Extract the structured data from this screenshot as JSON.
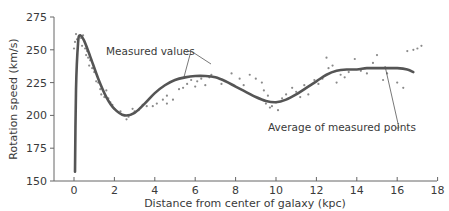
{
  "chart_data": {
    "type": "scatter",
    "title": "",
    "xlabel": "Distance from center of galaxy (kpc)",
    "ylabel": "Rotation speed (km/s)",
    "xlim": [
      -1,
      18
    ],
    "ylim": [
      150,
      275
    ],
    "xticks": [
      0,
      2,
      4,
      6,
      8,
      10,
      12,
      14,
      16,
      18
    ],
    "yticks": [
      150,
      175,
      200,
      225,
      250,
      275
    ],
    "grid": false,
    "legend": null,
    "annotations": [
      {
        "text": "Measured values",
        "points_to": [
          [
            4.4,
            233
          ],
          [
            6.6,
            222
          ]
        ]
      },
      {
        "text": "Average of measured points",
        "points_to": [
          [
            15.1,
            231
          ]
        ]
      }
    ],
    "series": [
      {
        "name": "Average of measured points",
        "type": "line",
        "x": [
          0.05,
          0.1,
          0.2,
          0.3,
          0.5,
          0.8,
          1.2,
          1.6,
          2.0,
          2.5,
          3.0,
          3.5,
          4.0,
          4.5,
          5.0,
          5.5,
          6.0,
          6.5,
          7.0,
          7.5,
          8.0,
          8.5,
          9.0,
          9.5,
          10.0,
          10.5,
          11.0,
          11.5,
          12.0,
          12.5,
          13.0,
          13.5,
          14.0,
          14.5,
          15.0,
          15.5,
          16.0,
          16.5,
          16.8
        ],
        "y": [
          157,
          220,
          255,
          261,
          257,
          245,
          228,
          214,
          205,
          200,
          202,
          209,
          217,
          223,
          227,
          229,
          230,
          230,
          229,
          226,
          222,
          218,
          214,
          211,
          210,
          212,
          216,
          221,
          226,
          231,
          234,
          235,
          235,
          236,
          236,
          236,
          236,
          235,
          233
        ]
      },
      {
        "name": "Measured values",
        "type": "scatter",
        "points": [
          [
            0.0,
            251
          ],
          [
            0.05,
            256
          ],
          [
            0.1,
            262
          ],
          [
            0.15,
            258
          ],
          [
            0.2,
            254
          ],
          [
            0.3,
            261
          ],
          [
            0.35,
            259
          ],
          [
            0.4,
            253
          ],
          [
            0.45,
            261
          ],
          [
            0.55,
            251
          ],
          [
            0.6,
            246
          ],
          [
            0.65,
            249
          ],
          [
            0.7,
            244
          ],
          [
            0.75,
            238
          ],
          [
            0.8,
            242
          ],
          [
            0.9,
            236
          ],
          [
            1.0,
            233
          ],
          [
            1.1,
            226
          ],
          [
            1.2,
            225
          ],
          [
            1.3,
            220
          ],
          [
            1.35,
            216
          ],
          [
            1.5,
            214
          ],
          [
            1.6,
            219
          ],
          [
            1.7,
            213
          ],
          [
            1.8,
            210
          ],
          [
            1.9,
            208
          ],
          [
            2.0,
            205
          ],
          [
            2.3,
            203
          ],
          [
            2.6,
            197
          ],
          [
            2.7,
            199
          ],
          [
            2.9,
            205
          ],
          [
            3.0,
            203
          ],
          [
            3.2,
            204
          ],
          [
            3.4,
            208
          ],
          [
            3.6,
            207
          ],
          [
            3.9,
            207
          ],
          [
            4.1,
            209
          ],
          [
            4.4,
            212
          ],
          [
            4.6,
            215
          ],
          [
            4.6,
            209
          ],
          [
            4.9,
            212
          ],
          [
            5.2,
            220
          ],
          [
            5.4,
            221
          ],
          [
            5.6,
            224
          ],
          [
            5.8,
            227
          ],
          [
            6.0,
            222
          ],
          [
            6.1,
            226
          ],
          [
            6.3,
            228
          ],
          [
            6.5,
            223
          ],
          [
            6.7,
            229
          ],
          [
            6.8,
            231
          ],
          [
            7.3,
            224
          ],
          [
            7.8,
            232
          ],
          [
            8.2,
            228
          ],
          [
            8.4,
            223
          ],
          [
            8.7,
            231
          ],
          [
            9.0,
            228
          ],
          [
            9.3,
            225
          ],
          [
            9.4,
            219
          ],
          [
            9.6,
            215
          ],
          [
            9.8,
            207
          ],
          [
            10.0,
            210
          ],
          [
            9.5,
            209
          ],
          [
            9.7,
            206
          ],
          [
            10.1,
            204
          ],
          [
            10.3,
            213
          ],
          [
            10.5,
            216
          ],
          [
            10.8,
            221
          ],
          [
            11.0,
            218
          ],
          [
            11.2,
            214
          ],
          [
            11.4,
            223
          ],
          [
            11.6,
            216
          ],
          [
            11.9,
            227
          ],
          [
            12.1,
            224
          ],
          [
            12.3,
            228
          ],
          [
            12.5,
            244
          ],
          [
            12.6,
            236
          ],
          [
            12.8,
            238
          ],
          [
            13.0,
            225
          ],
          [
            13.2,
            231
          ],
          [
            13.4,
            229
          ],
          [
            13.6,
            233
          ],
          [
            13.9,
            243
          ],
          [
            14.2,
            234
          ],
          [
            14.5,
            232
          ],
          [
            14.8,
            240
          ],
          [
            15.0,
            246
          ],
          [
            15.3,
            227
          ],
          [
            15.5,
            232
          ],
          [
            16.0,
            225
          ],
          [
            16.3,
            221
          ],
          [
            16.5,
            249
          ],
          [
            16.8,
            250
          ],
          [
            17.0,
            251
          ],
          [
            17.2,
            253
          ]
        ]
      }
    ]
  },
  "labels": {
    "xlabel": "Distance from center of galaxy (kpc)",
    "ylabel": "Rotation speed (km/s)",
    "annotation_measured": "Measured values",
    "annotation_average": "Average of measured points",
    "xticks": [
      "0",
      "2",
      "4",
      "6",
      "8",
      "10",
      "12",
      "14",
      "16",
      "18"
    ],
    "yticks": [
      "150",
      "175",
      "200",
      "225",
      "250",
      "275"
    ]
  },
  "colors": {
    "curve": "#555555",
    "points": "#8a8a8a",
    "axis": "#666666",
    "text": "#3a3a3a"
  }
}
